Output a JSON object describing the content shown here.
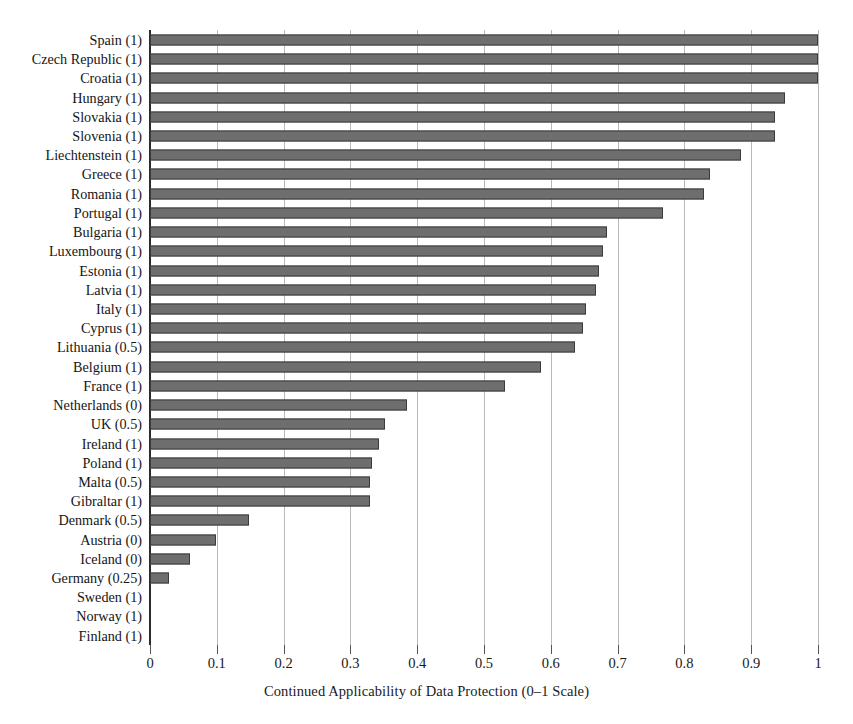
{
  "chart_data": {
    "type": "bar",
    "orientation": "horizontal",
    "title": "",
    "xlabel": "Continued Applicability of Data Protection (0–1 Scale)",
    "ylabel": "",
    "xlim": [
      0,
      1
    ],
    "grid": true,
    "legend": false,
    "xticks": [
      "0",
      "0.1",
      "0.2",
      "0.3",
      "0.4",
      "0.5",
      "0.6",
      "0.7",
      "0.8",
      "0.9",
      "1"
    ],
    "xtick_values": [
      0,
      0.1,
      0.2,
      0.3,
      0.4,
      0.5,
      0.6,
      0.7,
      0.8,
      0.9,
      1
    ],
    "bar_color": "#6e6e6e",
    "bar_edge_color": "#3b3b3b",
    "categories": [
      "Spain (1)",
      "Czech Republic (1)",
      "Croatia (1)",
      "Hungary (1)",
      "Slovakia (1)",
      "Slovenia (1)",
      "Liechtenstein (1)",
      "Greece (1)",
      "Romania (1)",
      "Portugal (1)",
      "Bulgaria (1)",
      "Luxembourg (1)",
      "Estonia (1)",
      "Latvia (1)",
      "Italy (1)",
      "Cyprus (1)",
      "Lithuania (0.5)",
      "Belgium (1)",
      "France (1)",
      "Netherlands (0)",
      "UK (0.5)",
      "Ireland (1)",
      "Poland (1)",
      "Malta (0.5)",
      "Gibraltar (1)",
      "Denmark (0.5)",
      "Austria (0)",
      "Iceland (0)",
      "Germany (0.25)",
      "Sweden (1)",
      "Norway (1)",
      "Finland (1)"
    ],
    "values": [
      1.0,
      1.0,
      1.0,
      0.95,
      0.935,
      0.935,
      0.885,
      0.838,
      0.83,
      0.768,
      0.684,
      0.678,
      0.672,
      0.668,
      0.652,
      0.648,
      0.636,
      0.585,
      0.532,
      0.385,
      0.352,
      0.343,
      0.332,
      0.33,
      0.33,
      0.148,
      0.099,
      0.06,
      0.028,
      0.0,
      0.0,
      0.0
    ]
  }
}
